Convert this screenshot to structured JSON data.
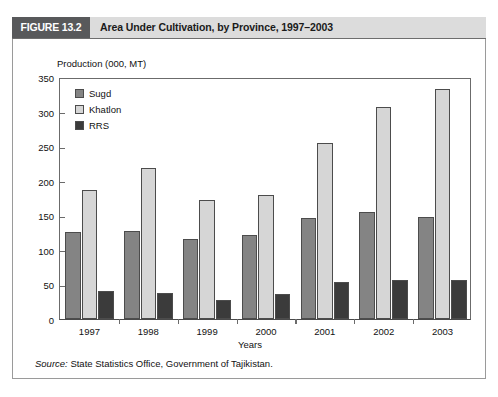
{
  "header": {
    "figure_tag": "FIGURE 13.2",
    "title": "Area Under Cultivation, by Province, 1997–2003"
  },
  "source": {
    "label": "Source:",
    "text": "State Statistics Office, Government of Tajikistan."
  },
  "colors": {
    "sugd": "#848484",
    "khatlon": "#d6d6d6",
    "rrs": "#3b3b3b",
    "tag_background": "#58595b",
    "header_background": "#dcdcdc",
    "axis": "#6b6b6b"
  },
  "chart_data": {
    "type": "bar",
    "title": "Area Under Cultivation, by Province, 1997–2003",
    "xlabel": "Years",
    "ylabel": "Production (000, MT)",
    "categories": [
      "1997",
      "1998",
      "1999",
      "2000",
      "2001",
      "2002",
      "2003"
    ],
    "series": [
      {
        "name": "Sugd",
        "color": "#848484",
        "values": [
          126,
          128,
          116,
          122,
          146,
          155,
          148
        ]
      },
      {
        "name": "Khatlon",
        "color": "#d6d6d6",
        "values": [
          187,
          218,
          172,
          179,
          254,
          306,
          333
        ]
      },
      {
        "name": "RRS",
        "color": "#3b3b3b",
        "values": [
          40,
          37,
          27,
          36,
          54,
          57,
          56
        ]
      }
    ],
    "ylim": [
      0,
      350
    ],
    "yticks": [
      0,
      50,
      100,
      150,
      200,
      250,
      300,
      350
    ],
    "ytick_labels": [
      "0",
      "50",
      "100",
      "150",
      "200",
      "250",
      "300",
      "350"
    ],
    "grid": false,
    "legend_position": "top-left"
  }
}
